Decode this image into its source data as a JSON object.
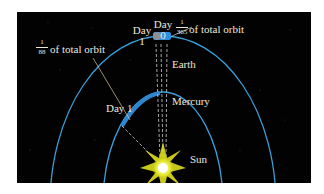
{
  "diagram": {
    "labels": {
      "day1_earth_line1": "Day",
      "day1_earth_line2": "1",
      "day0_line1": "Day",
      "day0_line2": "0",
      "earth": "Earth",
      "mercury": "Mercury",
      "sun": "Sun",
      "day1_mercury": "Day 1"
    },
    "fractions": {
      "earth": {
        "numerator": "1",
        "denominator": "365",
        "suffix": "of total orbit"
      },
      "mercury": {
        "numerator": "1",
        "denominator": "88",
        "suffix": "of total orbit"
      }
    },
    "colors": {
      "background": "#020203",
      "orbit": "#3a9fd6",
      "arc_highlight": "#2f86d0",
      "sun": "#f4f25a",
      "text": "#ece8dc"
    }
  }
}
